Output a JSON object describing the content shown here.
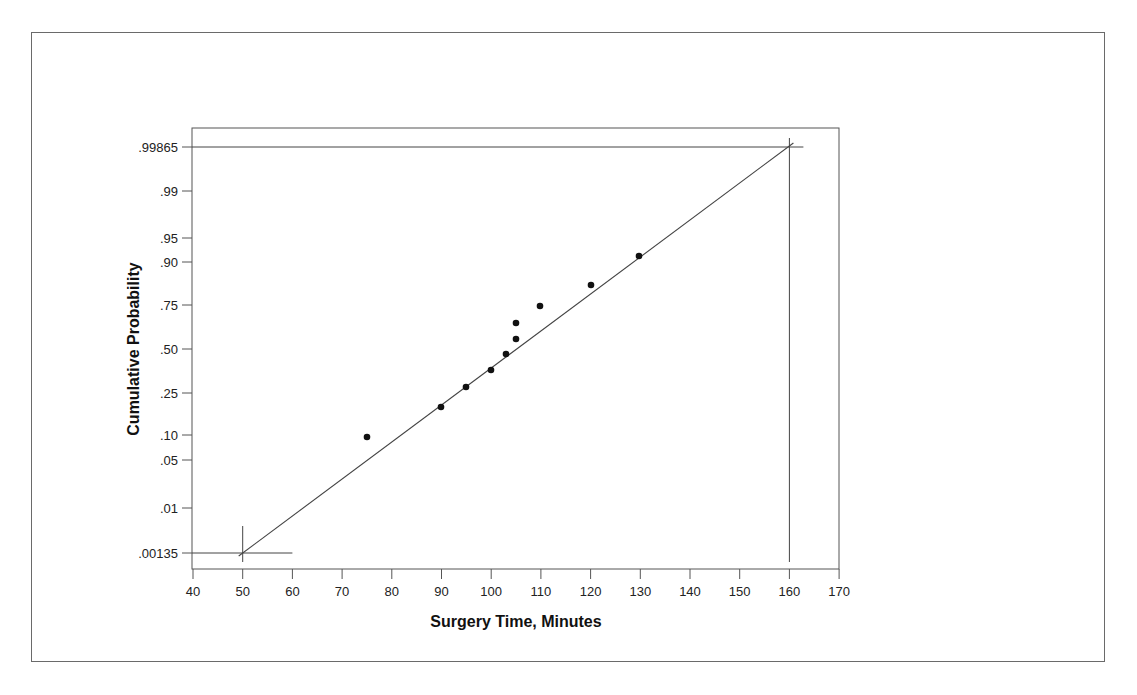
{
  "chart_data": {
    "type": "scatter",
    "title": "",
    "xlabel": "Surgery Time, Minutes",
    "ylabel": "Cumulative Probability",
    "xlim": [
      40,
      170
    ],
    "x_ticks": [
      "40",
      "50",
      "60",
      "70",
      "80",
      "90",
      "100",
      "110",
      "120",
      "130",
      "140",
      "150",
      "160",
      "170"
    ],
    "y_scale": "normal-probability",
    "y_ticks": [
      ".99865",
      ".99",
      ".95",
      ".90",
      ".75",
      ".50",
      ".25",
      ".10",
      ".05",
      ".01",
      ".00135"
    ],
    "y_tick_values": [
      0.99865,
      0.99,
      0.95,
      0.9,
      0.75,
      0.5,
      0.25,
      0.1,
      0.05,
      0.01,
      0.00135
    ],
    "grid": false,
    "legend": null,
    "series": [
      {
        "name": "Observed surgery times",
        "marker": "filled-circle",
        "x": [
          75,
          90,
          95,
          100,
          103,
          105,
          105,
          110,
          120,
          130
        ],
        "y": [
          0.09,
          0.17,
          0.28,
          0.36,
          0.45,
          0.55,
          0.64,
          0.74,
          0.82,
          0.91
        ]
      },
      {
        "name": "Fitted normal line",
        "marker": "line",
        "x": [
          50,
          160
        ],
        "y": [
          0.00135,
          0.99865
        ]
      }
    ],
    "annotations": [
      {
        "type": "reference-crosshair",
        "x": 50,
        "y": 0.00135,
        "note": "lower 3-sigma limit"
      },
      {
        "type": "reference-crosshair",
        "x": 160,
        "y": 0.99865,
        "note": "upper 3-sigma limit"
      }
    ]
  },
  "layout": {
    "plot": {
      "left": 192,
      "top": 128,
      "right": 839,
      "bottom": 569
    },
    "y_tick_px": [
      147,
      191,
      238,
      262,
      305,
      349,
      393,
      435,
      460,
      508,
      553
    ],
    "x_px_per_unit": 4.97,
    "x_origin_px": 193,
    "x_origin_val": 40,
    "point_px": [
      [
        367,
        437
      ],
      [
        441,
        407
      ],
      [
        466,
        387
      ],
      [
        491,
        370
      ],
      [
        506,
        354
      ],
      [
        516,
        339
      ],
      [
        516,
        323
      ],
      [
        540,
        306
      ],
      [
        591,
        285
      ],
      [
        639,
        256
      ]
    ]
  },
  "colors": {
    "axis": "#555555",
    "point": "#111111",
    "line": "#444444",
    "frame": "#6a6a6a"
  }
}
